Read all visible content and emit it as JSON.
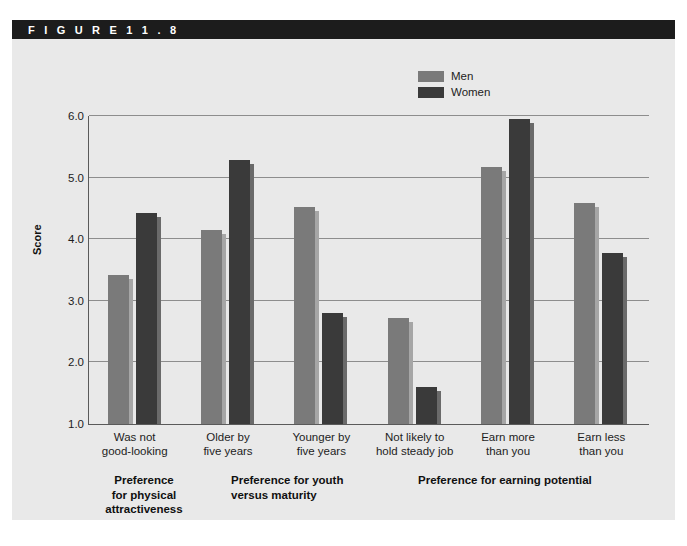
{
  "figure": {
    "label": "F I G U R E    1 1 . 8"
  },
  "legend": {
    "items": [
      {
        "name": "Men",
        "color": "#7a7a7a"
      },
      {
        "name": "Women",
        "color": "#3a3a3a"
      }
    ]
  },
  "axis": {
    "y_title": "Score",
    "y_ticks": [
      "6.0",
      "5.0",
      "4.0",
      "3.0",
      "2.0",
      "1.0"
    ]
  },
  "groups": [
    {
      "label": "Preference\nfor physical\nattractiveness",
      "line1": "Preference",
      "line2": "for physical",
      "line3": "attractiveness"
    },
    {
      "label": "Preference for youth\nversus maturity",
      "line1": "Preference for youth",
      "line2": "versus maturity",
      "line3": ""
    },
    {
      "label": "Preference for earning potential",
      "line1": "Preference for earning potential",
      "line2": "",
      "line3": ""
    }
  ],
  "categories": [
    {
      "line1": "Was not",
      "line2": "good-looking"
    },
    {
      "line1": "Older by",
      "line2": "five years"
    },
    {
      "line1": "Younger by",
      "line2": "five years"
    },
    {
      "line1": "Not likely to",
      "line2": "hold steady job"
    },
    {
      "line1": "Earn more",
      "line2": "than you"
    },
    {
      "line1": "Earn less",
      "line2": "than you"
    }
  ],
  "chart_data": {
    "type": "bar",
    "title": "F I G U R E   1 1 . 8",
    "xlabel": "",
    "ylabel": "Score",
    "ylim": [
      1.0,
      6.0
    ],
    "yticks": [
      1.0,
      2.0,
      3.0,
      4.0,
      5.0,
      6.0
    ],
    "grid": true,
    "legend_position": "top-right",
    "categories": [
      "Was not good-looking",
      "Older by five years",
      "Younger by five years",
      "Not likely to hold steady job",
      "Earn more than you",
      "Earn less than you"
    ],
    "category_groups": [
      {
        "name": "Preference for physical attractiveness",
        "categories": [
          "Was not good-looking"
        ]
      },
      {
        "name": "Preference for youth versus maturity",
        "categories": [
          "Older by five years",
          "Younger by five years"
        ]
      },
      {
        "name": "Preference for earning potential",
        "categories": [
          "Not likely to hold steady job",
          "Earn more than you",
          "Earn less than you"
        ]
      }
    ],
    "series": [
      {
        "name": "Men",
        "color": "#7a7a7a",
        "values": [
          3.42,
          4.15,
          4.53,
          2.72,
          5.18,
          4.58
        ]
      },
      {
        "name": "Women",
        "color": "#3a3a3a",
        "values": [
          4.42,
          5.28,
          2.8,
          1.6,
          5.95,
          3.78
        ]
      }
    ]
  },
  "colors": {
    "panel_background": "#e9e9e9",
    "header_background": "#1c1c1c",
    "axis_line": "#5a5a5a",
    "gridline": "#8d8d8d",
    "men_bar": "#7a7a7a",
    "women_bar": "#3a3a3a"
  }
}
